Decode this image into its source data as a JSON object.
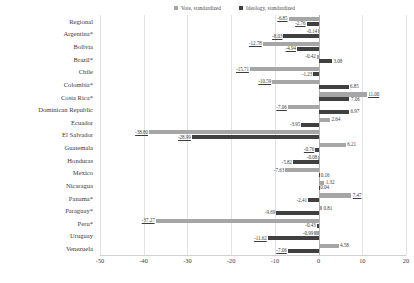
{
  "legend": {
    "position": "top",
    "entries": [
      {
        "label": "Vote, standardized",
        "color": "#a6a6a6",
        "key": "vote"
      },
      {
        "label": "Ideology, standardized",
        "color": "#404040",
        "key": "ideology"
      }
    ]
  },
  "axis": {
    "xlabel": "",
    "ylabel": "",
    "xmin": -50,
    "xmax": 20,
    "xticks": [
      -50,
      -40,
      -30,
      -20,
      -10,
      0,
      10,
      20
    ],
    "xtick_labels": [
      "-50",
      "-40",
      "-30",
      "-20",
      "-10",
      "0",
      "10",
      "20"
    ],
    "grid": true
  },
  "chart_data": {
    "type": "bar",
    "orientation": "horizontal",
    "title": "",
    "xlabel": "",
    "ylabel": "",
    "xlim": [
      -50,
      20
    ],
    "grid": true,
    "legend_position": "top",
    "categories": [
      "Regional",
      "Argentina*",
      "Bolivia",
      "Brazil*",
      "Chile",
      "Colombia*",
      "Costa Rica*",
      "Dominican Republic",
      "Ecuador",
      "El Salvador",
      "Guatemala",
      "Honduras",
      "Mexico",
      "Nicaragua",
      "Panama*",
      "Paraguay*",
      "Peru*",
      "Uruguay",
      "Venezuela"
    ],
    "series": [
      {
        "name": "Vote, standardized",
        "color": "#a6a6a6",
        "values": [
          -6.85,
          -0.14,
          -12.78,
          -0.42,
          -15.71,
          -10.59,
          11.0,
          -7.06,
          2.64,
          -38.8,
          6.21,
          -0.08,
          -7.63,
          1.32,
          7.47,
          0.81,
          -37.27,
          -0.99,
          4.58
        ],
        "labels": [
          "-6.85",
          "-0.14",
          "-12.78",
          "-0.42",
          "-15.71",
          "-10.59",
          "11.00",
          "-7.06",
          "2.64",
          "-38.80",
          "6.21",
          "-0.08",
          "-7.63",
          "1.32",
          "7.47",
          "0.81",
          "-37.27",
          "-0.99",
          "4.58"
        ]
      },
      {
        "name": "Ideology, standardized",
        "color": "#404040",
        "values": [
          -2.76,
          -8.03,
          -4.94,
          3.08,
          -1.23,
          6.85,
          7.06,
          6.97,
          -3.95,
          -28.99,
          -0.76,
          -5.82,
          0.16,
          0.04,
          -2.41,
          -9.69,
          -0.43,
          -11.62,
          -7.06
        ],
        "labels": [
          "-2.76",
          "-8.03",
          "-4.94",
          "3.08",
          "-1.23",
          "6.85",
          "7.06",
          "6.97",
          "-3.95",
          "-28.99",
          "-0.76",
          "-5.82",
          "0.16",
          "0.04",
          "-2.41",
          "-9.69",
          "-0.43",
          "-11.62",
          "-7.06"
        ]
      }
    ],
    "emphasized_labels": [
      "-6.85",
      "-2.76",
      "-8.03",
      "-12.78",
      "-4.94",
      "-15.71",
      "-10.59",
      "11.00",
      "-7.06",
      "-38.80",
      "-28.99",
      "-0.76",
      "7.47",
      "-37.27",
      "-11.62"
    ]
  }
}
